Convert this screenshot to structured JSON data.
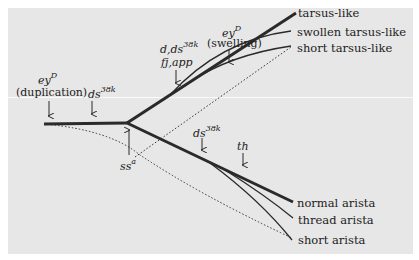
{
  "diagram": {
    "outcomes": [
      {
        "label": "tarsus-like"
      },
      {
        "label": "swollen tarsus-like"
      },
      {
        "label": "short tarsus-like"
      },
      {
        "label": "normal arista"
      },
      {
        "label": "thread arista"
      },
      {
        "label": "short arista"
      }
    ],
    "annotations": {
      "eyD_dup": {
        "gene": "ey",
        "sup": "D",
        "note": "(duplication)"
      },
      "ds_early": {
        "gene": "ds",
        "sup": "38k"
      },
      "ssa": {
        "gene": "ss",
        "sup": "a"
      },
      "d_ds": {
        "line1": "d,ds",
        "sup": "38k",
        "line2": "fj,app"
      },
      "eyD_swell": {
        "gene": "ey",
        "sup": "D",
        "note": "(swelling)"
      },
      "ds_lower": {
        "gene": "ds",
        "sup": "38k"
      },
      "th": {
        "gene": "th"
      }
    },
    "colors": {
      "panel": "#e7e7e7",
      "line": "#2a2a2a"
    }
  }
}
